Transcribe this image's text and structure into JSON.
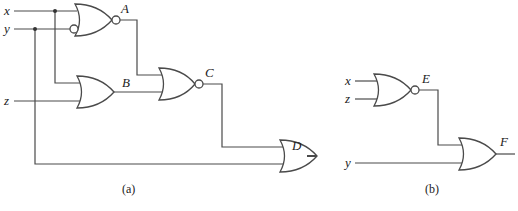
{
  "diagram": {
    "type": "logic-circuit",
    "colors": {
      "line": "#4a4a4a",
      "text": "#222222",
      "background": "#ffffff"
    },
    "part_a": {
      "caption": "(a)",
      "inputs": {
        "x": "x",
        "y": "y",
        "z": "z"
      },
      "gates": {
        "A": {
          "label": "A",
          "type": "NOR",
          "inputs": [
            "x",
            "NOT y"
          ]
        },
        "B": {
          "label": "B",
          "type": "OR",
          "inputs": [
            "x",
            "z"
          ]
        },
        "C": {
          "label": "C",
          "type": "NOR",
          "inputs": [
            "A",
            "B"
          ]
        },
        "D": {
          "label": "D",
          "type": "OR",
          "inputs": [
            "C",
            "y"
          ]
        }
      }
    },
    "part_b": {
      "caption": "(b)",
      "inputs": {
        "x": "x",
        "z": "z",
        "y": "y"
      },
      "gates": {
        "E": {
          "label": "E",
          "type": "NOR",
          "inputs": [
            "x",
            "z"
          ]
        },
        "F": {
          "label": "F",
          "type": "OR",
          "inputs": [
            "E",
            "y"
          ]
        }
      }
    }
  }
}
